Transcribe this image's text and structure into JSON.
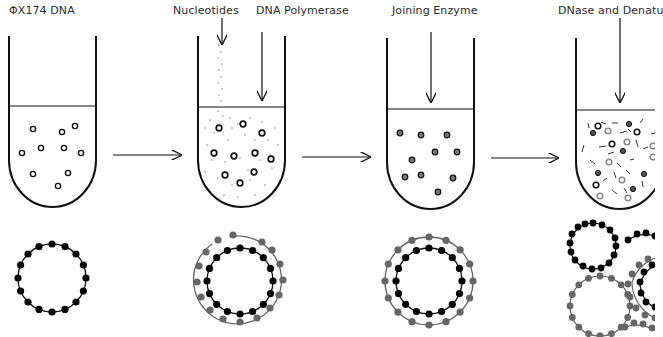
{
  "diagram": {
    "colors": {
      "line": "#111111",
      "template_strand": "#000000",
      "synthesized_strand": "#666666",
      "nucleotide_dots": "#8a8a8a"
    },
    "steps": [
      {
        "id": "step1",
        "labels": [
          "ΦX174 DNA"
        ],
        "tube_contents": "circular single-stranded DNA (open circles)",
        "circle_diagram": "single black circular strand, 16 beads"
      },
      {
        "id": "step2",
        "labels": [
          "Nucleotides",
          "DNA Polymerase"
        ],
        "tube_contents": "open circles plus scattered nucleotide dots",
        "circle_diagram": "black inner circle with gray complementary strand (open gap)"
      },
      {
        "id": "step3",
        "labels": [
          "Joining Enzyme"
        ],
        "tube_contents": "filled/closed double circles",
        "circle_diagram": "black inner circle and closed gray outer circle"
      },
      {
        "id": "step4",
        "labels": [
          "DNase and Denatu"
        ],
        "tube_contents": "mixture of black and gray circles with fragments",
        "circle_diagram": "separated black and gray circles and fragments"
      }
    ],
    "arrows": [
      "step1→step2",
      "step2→step3",
      "step3→step4"
    ]
  }
}
